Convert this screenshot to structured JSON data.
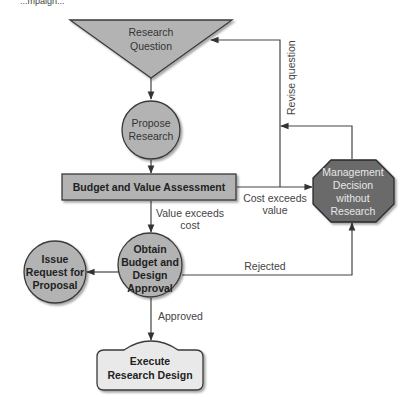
{
  "header": {
    "cropped_caption": "...mpaign..."
  },
  "colors": {
    "node_fill": "#b3b3b3",
    "node_stroke": "#3a3a3a",
    "decision_fill": "#6b6b6b",
    "terminal_fill": "#e9e9e9",
    "line": "#444444"
  },
  "nodes": {
    "research_question": {
      "line1": "Research",
      "line2": "Question"
    },
    "propose_research": {
      "line1": "Propose",
      "line2": "Research"
    },
    "budget_value": {
      "label": "Budget and Value Assessment"
    },
    "management_decision": {
      "line1": "Management",
      "line2": "Decision",
      "line3": "without",
      "line4": "Research"
    },
    "obtain_approval": {
      "line1": "Obtain",
      "line2": "Budget and",
      "line3": "Design",
      "line4": "Approval"
    },
    "issue_rfp": {
      "line1": "Issue",
      "line2": "Request for",
      "line3": "Proposal"
    },
    "execute_design": {
      "line1": "Execute",
      "line2": "Research Design"
    }
  },
  "edges": {
    "revise_question": "Revise question",
    "cost_exceeds_value": {
      "line1": "Cost exceeds",
      "line2": "value"
    },
    "value_exceeds_cost": {
      "line1": "Value exceeds",
      "line2": "cost"
    },
    "rejected": "Rejected",
    "approved": "Approved"
  }
}
